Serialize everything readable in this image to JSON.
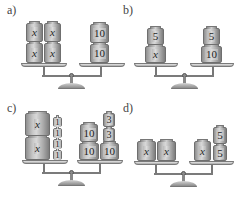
{
  "figure": {
    "panels": [
      {
        "id": "a",
        "label": "a)",
        "left_pan": {
          "stacks": [
            [
              "x",
              "x"
            ],
            [
              "x",
              "x"
            ]
          ]
        },
        "right_pan": {
          "stacks": [
            [
              "10",
              "10"
            ]
          ]
        }
      },
      {
        "id": "b",
        "label": "b)",
        "left_pan": {
          "stacks": [
            [
              "x",
              "5"
            ]
          ]
        },
        "right_pan": {
          "stacks": [
            [
              "10",
              "5"
            ]
          ]
        }
      },
      {
        "id": "c",
        "label": "c)",
        "left_pan": {
          "stacks": [
            [
              "x",
              "x"
            ],
            [
              "1",
              "1",
              "1",
              "1"
            ]
          ]
        },
        "right_pan": {
          "stacks": [
            [
              "10",
              "10"
            ],
            [
              "10",
              "3",
              "3"
            ]
          ]
        }
      },
      {
        "id": "d",
        "label": "d)",
        "left_pan": {
          "stacks": [
            [
              "x"
            ],
            [
              "x"
            ]
          ]
        },
        "right_pan": {
          "stacks": [
            [
              "x"
            ],
            [
              "5",
              "5"
            ]
          ]
        }
      }
    ]
  },
  "colors": {
    "weight_fill": "#c9c9c9",
    "weight_border": "#6f6f6f",
    "text": "#1e1e1e",
    "background": "#ffffff"
  }
}
